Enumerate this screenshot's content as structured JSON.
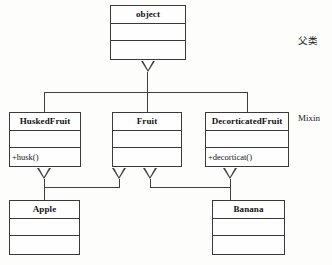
{
  "diagram": {
    "type": "uml-class-diagram",
    "title": "",
    "classes": [
      {
        "id": "object",
        "name": "object",
        "attributes": "",
        "operations": "",
        "role": "base"
      },
      {
        "id": "huskedfruit",
        "name": "HuskedFruit",
        "attributes": "",
        "operations": "+husk()",
        "role": "mixin"
      },
      {
        "id": "fruit",
        "name": "Fruit",
        "attributes": "",
        "operations": "",
        "role": "mixin"
      },
      {
        "id": "decorticatedfruit",
        "name": "DecorticatedFruit",
        "attributes": "",
        "operations": "+decorticat()",
        "role": "mixin"
      },
      {
        "id": "apple",
        "name": "Apple",
        "attributes": "",
        "operations": "",
        "role": "concrete"
      },
      {
        "id": "banana",
        "name": "Banana",
        "attributes": "",
        "operations": "",
        "role": "concrete"
      }
    ],
    "generalizations": [
      {
        "from": "HuskedFruit",
        "to": "object"
      },
      {
        "from": "Fruit",
        "to": "object"
      },
      {
        "from": "DecorticatedFruit",
        "to": "object"
      },
      {
        "from": "Apple",
        "to": "HuskedFruit"
      },
      {
        "from": "Apple",
        "to": "Fruit"
      },
      {
        "from": "Banana",
        "to": "Fruit"
      },
      {
        "from": "Banana",
        "to": "DecorticatedFruit"
      }
    ],
    "annotations": {
      "parent_class_label": "父类",
      "mixin_label": "Mixin"
    },
    "colors": {
      "line": "#3f3f3f",
      "box_fill": "#fefefe",
      "text": "#121212",
      "background": "#fdfdfb"
    }
  }
}
